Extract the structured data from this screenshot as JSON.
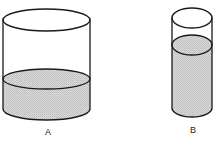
{
  "diagram": {
    "type": "two-cylinders-liquid-comparison",
    "colors": {
      "stroke": "#1a1a1a",
      "liquid": "#d6d6d6",
      "liquid_dot": "#b8b8b8",
      "background": "#ffffff"
    },
    "cylinders": [
      {
        "id": "A",
        "label": "A",
        "description": "wide cylinder, liquid low",
        "left": 3,
        "right": 90,
        "top_cy": 20,
        "ry": 11,
        "liquid_cy": 79,
        "bottom_cy": 109,
        "label_x": 48,
        "label_y": 132
      },
      {
        "id": "B",
        "label": "B",
        "description": "narrow cylinder, liquid high",
        "left": 172,
        "right": 212,
        "top_cy": 18,
        "ry": 10,
        "liquid_cy": 45,
        "bottom_cy": 108,
        "label_x": 193,
        "label_y": 130
      }
    ]
  }
}
